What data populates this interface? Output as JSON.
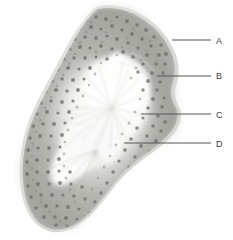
{
  "figure": {
    "kind": "histology-micrograph",
    "specimen_shape": "bean-shaped tissue section",
    "background_color": "#ffffff",
    "capsule_color": "#d8d8d4",
    "cortex_color": "#a9a9a4",
    "cortex_dark_color": "#9a9a95",
    "nucleus_color": "#6f6f6b",
    "medulla_color": "#f3f3f1",
    "fiber_color": "#cfcfca",
    "leader_color": "#555555"
  },
  "labels": [
    {
      "id": "label-a",
      "text": "A",
      "text_x": 216,
      "text_y": 44,
      "line_x1": 172,
      "line_x2": 211,
      "line_y": 40,
      "target": "capsule"
    },
    {
      "id": "label-b",
      "text": "B",
      "text_x": 216,
      "text_y": 79,
      "line_x1": 157,
      "line_x2": 211,
      "line_y": 76,
      "target": "cortex"
    },
    {
      "id": "label-c",
      "text": "C",
      "text_x": 216,
      "text_y": 118,
      "line_x1": 141,
      "line_x2": 211,
      "line_y": 114,
      "target": "medulla-edge"
    },
    {
      "id": "label-d",
      "text": "D",
      "text_x": 216,
      "text_y": 147,
      "line_x1": 124,
      "line_x2": 211,
      "line_y": 143,
      "target": "medulla-center"
    }
  ]
}
